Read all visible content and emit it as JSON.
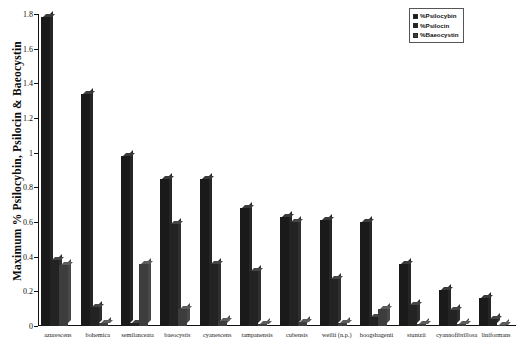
{
  "chart_data": {
    "type": "bar",
    "title": "",
    "xlabel": "",
    "ylabel": "Maximum % Psilocybin, Psilocin & Baeocystin",
    "ylim": [
      0,
      1.8
    ],
    "ytick_labels": [
      "1.8",
      "1.6",
      "1.4",
      "1.2",
      "1",
      "0.8",
      "0.6",
      "0.4",
      "0.2",
      "0"
    ],
    "ytick_values": [
      1.8,
      1.6,
      1.4,
      1.2,
      1.0,
      0.8,
      0.6,
      0.4,
      0.2,
      0
    ],
    "grid": false,
    "legend_position": "top-right",
    "categories": [
      "azurescens",
      "bohemica",
      "semilanceata",
      "baeocystis",
      "cyanescens",
      "tampanensis",
      "cubensis",
      "weilii (n.p.)",
      "hoogshagenii",
      "stuntzii",
      "cyannofibrillosa",
      "liniformans"
    ],
    "series": [
      {
        "name": "%Psilocybin",
        "color": "#1a1a1a",
        "values": [
          1.78,
          1.34,
          0.98,
          0.85,
          0.85,
          0.68,
          0.63,
          0.61,
          0.6,
          0.36,
          0.21,
          0.16
        ]
      },
      {
        "name": "%Psilocin",
        "color": "#232323",
        "values": [
          0.38,
          0.11,
          0.02,
          0.59,
          0.36,
          0.32,
          0.6,
          0.27,
          0.05,
          0.12,
          0.09,
          0.04
        ]
      },
      {
        "name": "%Baeocystin",
        "color": "#3d3d3d",
        "values": [
          0.35,
          0.02,
          0.36,
          0.1,
          0.03,
          0.01,
          0.025,
          0.02,
          0.1,
          0.01,
          0.01,
          0.005
        ]
      }
    ]
  },
  "legend": {
    "entries": [
      {
        "label": "%Psilocybin"
      },
      {
        "label": "%Psilocin"
      },
      {
        "label": "%Baeocystin"
      }
    ]
  },
  "axes": {
    "y_title": "Maximum % Psilocybin, Psilocin & Baeocystin"
  }
}
